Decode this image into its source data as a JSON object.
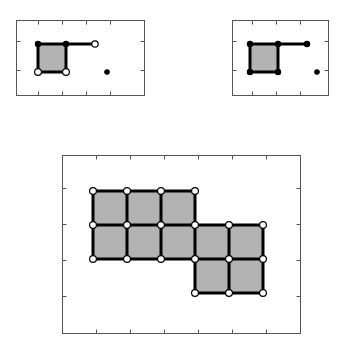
{
  "figure": {
    "type": "geometric-diagram",
    "title": "",
    "background_color": "#ffffff",
    "cell_fill_color": "#b3b3b3",
    "edge_color": "#000000",
    "frame_color": "#555555",
    "panel_count": 3
  },
  "panels": [
    {
      "id": "panel-top-left",
      "label": "",
      "frame": {
        "x": 16,
        "y": 20,
        "width": 128,
        "height": 75
      },
      "ticks_top": [
        38,
        62,
        86,
        110
      ],
      "ticks_bottom": [
        38,
        62,
        86,
        110
      ],
      "ticks_left": [
        41,
        70
      ],
      "ticks_right": [
        41,
        70
      ],
      "cells": [
        {
          "col": 0,
          "row": 0
        }
      ],
      "grid_origin": {
        "x": 38,
        "y": 44
      },
      "cell_size": 28,
      "vertices": [
        {
          "x": 38,
          "y": 44,
          "style": "solid"
        },
        {
          "x": 66,
          "y": 44,
          "style": "solid"
        },
        {
          "x": 38,
          "y": 72,
          "style": "open"
        },
        {
          "x": 66,
          "y": 72,
          "style": "open"
        }
      ],
      "arm": {
        "from_x": 66,
        "from_y": 44,
        "to_x": 95,
        "to_y": 44,
        "endpoint_style": "open"
      },
      "isolated_points": [
        {
          "x": 107,
          "y": 72
        }
      ]
    },
    {
      "id": "panel-top-right",
      "label": "",
      "frame": {
        "x": 232,
        "y": 20,
        "width": 96,
        "height": 75
      },
      "ticks_top": [
        252,
        276,
        300
      ],
      "ticks_bottom": [
        252,
        276,
        300
      ],
      "ticks_left": [
        41,
        70
      ],
      "ticks_right": [
        41,
        70
      ],
      "cells": [
        {
          "col": 0,
          "row": 0
        }
      ],
      "grid_origin": {
        "x": 250,
        "y": 44
      },
      "cell_size": 28,
      "vertices": [
        {
          "x": 250,
          "y": 44,
          "style": "solid"
        },
        {
          "x": 278,
          "y": 44,
          "style": "solid"
        },
        {
          "x": 250,
          "y": 72,
          "style": "solid"
        },
        {
          "x": 278,
          "y": 72,
          "style": "solid"
        }
      ],
      "arm": {
        "from_x": 278,
        "from_y": 44,
        "to_x": 307,
        "to_y": 44,
        "endpoint_style": "solid"
      },
      "isolated_points": [
        {
          "x": 317,
          "y": 72
        }
      ]
    },
    {
      "id": "panel-bottom",
      "label": "",
      "frame": {
        "x": 62,
        "y": 155,
        "width": 238,
        "height": 178
      },
      "ticks_top": [
        96,
        130,
        164,
        198,
        232,
        266
      ],
      "ticks_bottom": [
        96,
        130,
        164,
        198,
        232,
        266
      ],
      "ticks_left": [
        188,
        224,
        260,
        296
      ],
      "ticks_right": [
        188,
        224,
        260,
        296
      ],
      "cell_size": 34,
      "grid_origin": {
        "x": 93,
        "y": 191
      },
      "cells": [
        {
          "col": 0,
          "row": 0
        },
        {
          "col": 1,
          "row": 0
        },
        {
          "col": 2,
          "row": 0
        },
        {
          "col": 0,
          "row": 1
        },
        {
          "col": 1,
          "row": 1
        },
        {
          "col": 2,
          "row": 1
        },
        {
          "col": 3,
          "row": 1
        },
        {
          "col": 4,
          "row": 1
        },
        {
          "col": 3,
          "row": 2
        },
        {
          "col": 4,
          "row": 2
        }
      ],
      "vertices": [
        {
          "x": 93,
          "y": 191,
          "style": "open"
        },
        {
          "x": 127,
          "y": 191,
          "style": "open"
        },
        {
          "x": 161,
          "y": 191,
          "style": "open"
        },
        {
          "x": 195,
          "y": 191,
          "style": "open"
        },
        {
          "x": 93,
          "y": 225,
          "style": "open"
        },
        {
          "x": 127,
          "y": 225,
          "style": "open"
        },
        {
          "x": 161,
          "y": 225,
          "style": "open"
        },
        {
          "x": 195,
          "y": 225,
          "style": "open"
        },
        {
          "x": 229,
          "y": 225,
          "style": "open"
        },
        {
          "x": 263,
          "y": 225,
          "style": "open"
        },
        {
          "x": 93,
          "y": 259,
          "style": "open"
        },
        {
          "x": 127,
          "y": 259,
          "style": "open"
        },
        {
          "x": 161,
          "y": 259,
          "style": "open"
        },
        {
          "x": 195,
          "y": 259,
          "style": "open"
        },
        {
          "x": 229,
          "y": 259,
          "style": "open"
        },
        {
          "x": 263,
          "y": 259,
          "style": "open"
        },
        {
          "x": 195,
          "y": 293,
          "style": "open"
        },
        {
          "x": 229,
          "y": 293,
          "style": "open"
        },
        {
          "x": 263,
          "y": 293,
          "style": "open"
        }
      ],
      "isolated_points": []
    }
  ]
}
